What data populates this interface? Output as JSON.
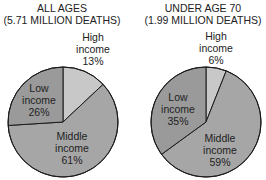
{
  "chart_data": [
    {
      "type": "pie",
      "title": "ALL AGES",
      "subtitle": "(5.71 MILLION DEATHS)",
      "categories": [
        "High income",
        "Middle income",
        "Low income"
      ],
      "values": [
        13,
        61,
        26
      ],
      "unit": "%",
      "colors": [
        "#c8c8c8",
        "#a6a6a6",
        "#9a9a9a"
      ]
    },
    {
      "type": "pie",
      "title": "UNDER AGE 70",
      "subtitle": "(1.99 MILLION DEATHS)",
      "categories": [
        "High income",
        "Middle income",
        "Low income"
      ],
      "values": [
        6,
        59,
        35
      ],
      "unit": "%",
      "colors": [
        "#c8c8c8",
        "#a6a6a6",
        "#9a9a9a"
      ]
    }
  ],
  "labels": {
    "left": {
      "title1": "ALL AGES",
      "title2": "(5.71 MILLION DEATHS)",
      "high": [
        "High",
        "income",
        "13%"
      ],
      "low": [
        "Low",
        "income",
        "26%"
      ],
      "middle": [
        "Middle",
        "income",
        "61%"
      ]
    },
    "right": {
      "title1": "UNDER AGE 70",
      "title2": "(1.99 MILLION DEATHS)",
      "high": [
        "High",
        "income",
        "6%"
      ],
      "low": [
        "Low",
        "income",
        "35%"
      ],
      "middle": [
        "Middle",
        "income",
        "59%"
      ]
    }
  }
}
